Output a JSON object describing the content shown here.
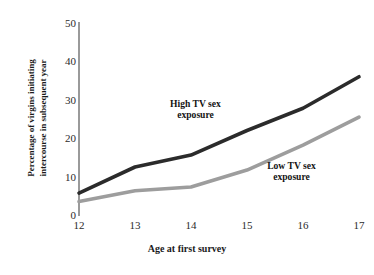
{
  "chart_data": {
    "type": "line",
    "title": "",
    "xlabel": "Age at first survey",
    "ylabel": "Percentage of virgins initiating intercourse in subsequent year",
    "ylabel_line1": "Percentage of virgins initiating",
    "ylabel_line2": "intercourse in subsequent year",
    "x": [
      12,
      13,
      14,
      15,
      16,
      17
    ],
    "categories": [
      "12",
      "13",
      "14",
      "15",
      "16",
      "17"
    ],
    "xtick_labels": [
      "12",
      "13",
      "14",
      "15",
      "16",
      "17"
    ],
    "ytick_labels": [
      "0",
      "10",
      "20",
      "30",
      "40",
      "50"
    ],
    "yticks": [
      0,
      10,
      20,
      30,
      40,
      50
    ],
    "xlim": [
      12,
      17
    ],
    "ylim": [
      0,
      50
    ],
    "grid": false,
    "legend_position": "inline-annotations",
    "series": [
      {
        "name": "High TV sex exposure",
        "label_line1": "High TV sex",
        "label_line2": "exposure",
        "color": "#2b2b2b",
        "values": [
          5.7,
          12.5,
          15.6,
          22.0,
          27.8,
          36.0
        ]
      },
      {
        "name": "Low TV sex exposure",
        "label_line1": "Low TV sex",
        "label_line2": "exposure",
        "color": "#9d9d9d",
        "values": [
          3.5,
          6.3,
          7.3,
          11.7,
          18.2,
          25.5
        ]
      }
    ],
    "annotations": [
      {
        "text": "High TV sex exposure",
        "series": "High TV sex exposure"
      },
      {
        "text": "Low TV sex exposure",
        "series": "Low TV sex exposure"
      }
    ],
    "axis_color": "#9a9a9a"
  }
}
